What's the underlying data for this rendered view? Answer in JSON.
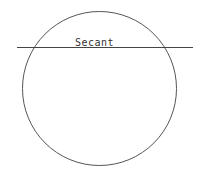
{
  "diagram": {
    "title": "Secant",
    "circle": {
      "cx": 99.5,
      "cy": 88.5,
      "r": 77,
      "stroke": "#555555"
    },
    "secant_line": {
      "x1": 17,
      "y1": 47.5,
      "x2": 193,
      "y2": 47.5,
      "stroke": "#444444"
    },
    "labels": [
      {
        "text": "Secant",
        "x": 75,
        "y": 46
      }
    ]
  }
}
